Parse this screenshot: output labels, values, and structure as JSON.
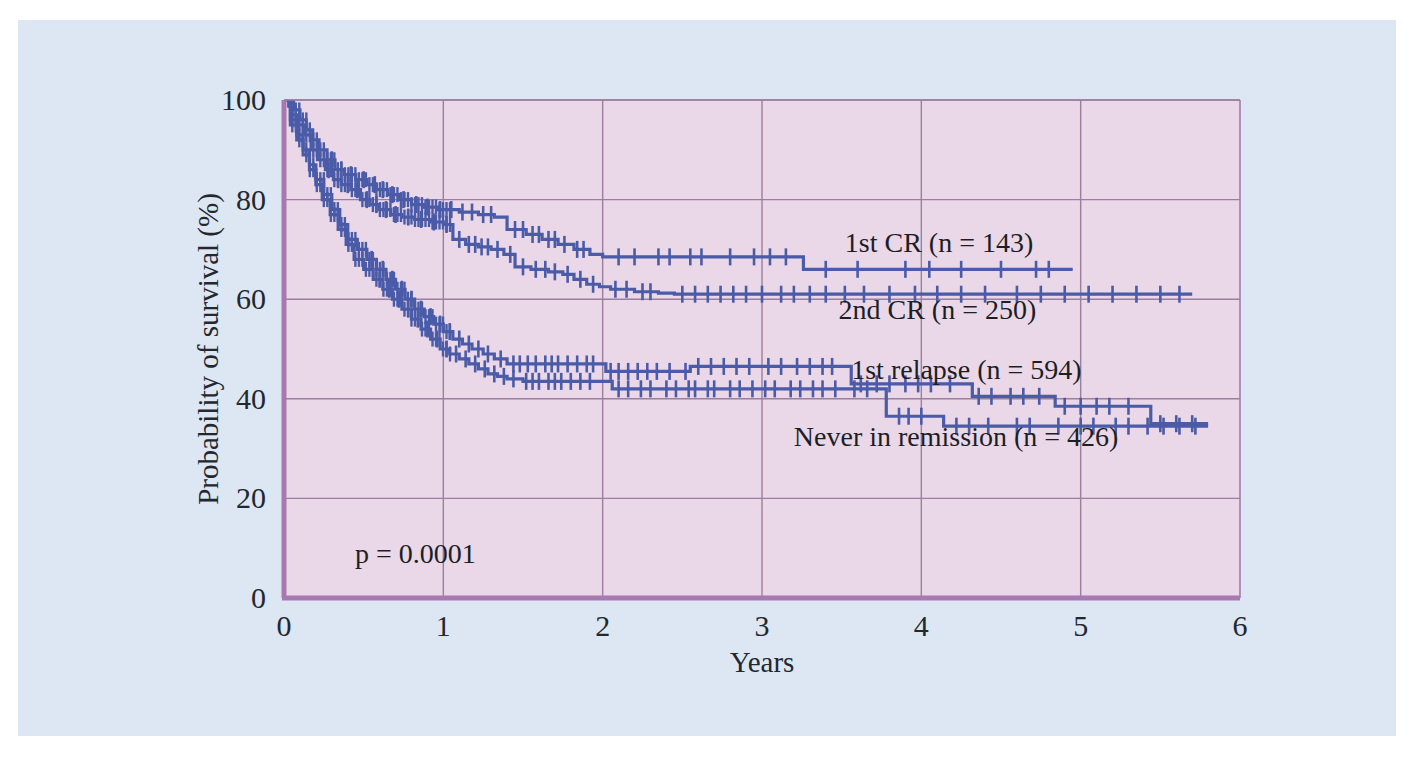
{
  "figure": {
    "background_color": "#dde7f3",
    "plot_background_color": "#ead7e8",
    "plot_border_color": "#a878b0",
    "grid_color": "#9b7fa0",
    "curve_color": "#4a5ba8",
    "page_color": "#ffffff"
  },
  "chart_data": {
    "type": "line",
    "subtype": "kaplan-meier-survival",
    "title": "",
    "xlabel": "Years",
    "ylabel": "Probability of survival (%)",
    "xlim": [
      0,
      6
    ],
    "ylim": [
      0,
      100
    ],
    "xticks": [
      "0",
      "1",
      "2",
      "3",
      "4",
      "5",
      "6"
    ],
    "yticks": [
      "0",
      "20",
      "40",
      "60",
      "80",
      "100"
    ],
    "grid": true,
    "legend_position": "inline-right-of-curves",
    "annotations": [
      {
        "name": "p-value",
        "text": "p = 0.0001",
        "x": 0.38,
        "y": 10
      }
    ],
    "series": [
      {
        "name": "1st CR (n = 143)",
        "label": "1st CR (n = 143)",
        "n": 143,
        "color": "#4a5ba8",
        "label_x": 3.52,
        "label_y": 69.5,
        "plateau_value": 66,
        "points": [
          [
            0.0,
            100
          ],
          [
            0.06,
            98
          ],
          [
            0.1,
            96
          ],
          [
            0.14,
            94
          ],
          [
            0.18,
            92
          ],
          [
            0.22,
            90
          ],
          [
            0.27,
            88
          ],
          [
            0.32,
            86
          ],
          [
            0.38,
            85
          ],
          [
            0.45,
            84
          ],
          [
            0.52,
            83
          ],
          [
            0.58,
            82
          ],
          [
            0.65,
            81
          ],
          [
            0.72,
            80
          ],
          [
            0.8,
            79
          ],
          [
            0.88,
            78.5
          ],
          [
            0.97,
            78
          ],
          [
            1.1,
            77.5
          ],
          [
            1.22,
            77
          ],
          [
            1.32,
            76.5
          ],
          [
            1.4,
            74
          ],
          [
            1.52,
            73
          ],
          [
            1.62,
            72
          ],
          [
            1.72,
            71
          ],
          [
            1.82,
            70
          ],
          [
            1.92,
            69
          ],
          [
            2.0,
            68.5
          ],
          [
            2.3,
            68.5
          ],
          [
            2.7,
            68.5
          ],
          [
            3.1,
            68.5
          ],
          [
            3.24,
            68.5
          ],
          [
            3.26,
            66
          ],
          [
            3.8,
            66
          ],
          [
            4.3,
            66
          ],
          [
            4.7,
            66
          ],
          [
            4.95,
            66
          ]
        ],
        "censor_marks": [
          0.3,
          0.36,
          0.42,
          0.5,
          0.57,
          0.62,
          0.68,
          0.75,
          0.83,
          0.9,
          0.98,
          1.05,
          1.12,
          1.18,
          1.25,
          1.3,
          1.45,
          1.5,
          1.56,
          1.6,
          1.66,
          1.7,
          1.76,
          1.84,
          1.88,
          2.1,
          2.2,
          2.35,
          2.42,
          2.55,
          2.62,
          2.8,
          2.95,
          3.05,
          3.15,
          3.4,
          3.6,
          3.9,
          4.05,
          4.25,
          4.5,
          4.72,
          4.8
        ]
      },
      {
        "name": "2nd CR (n = 250)",
        "label": "2nd CR (n = 250)",
        "n": 250,
        "color": "#4a5ba8",
        "label_x": 3.48,
        "label_y": 56,
        "plateau_value": 61,
        "points": [
          [
            0.0,
            100
          ],
          [
            0.05,
            97
          ],
          [
            0.09,
            95
          ],
          [
            0.13,
            93
          ],
          [
            0.17,
            90
          ],
          [
            0.21,
            88
          ],
          [
            0.26,
            86
          ],
          [
            0.31,
            84
          ],
          [
            0.36,
            83
          ],
          [
            0.42,
            82
          ],
          [
            0.48,
            80
          ],
          [
            0.54,
            79
          ],
          [
            0.6,
            78
          ],
          [
            0.67,
            77
          ],
          [
            0.74,
            76.5
          ],
          [
            0.82,
            76
          ],
          [
            0.92,
            75.5
          ],
          [
            1.0,
            75
          ],
          [
            1.06,
            72
          ],
          [
            1.14,
            71
          ],
          [
            1.22,
            70.5
          ],
          [
            1.3,
            70
          ],
          [
            1.38,
            69
          ],
          [
            1.45,
            66.5
          ],
          [
            1.55,
            66
          ],
          [
            1.66,
            65.5
          ],
          [
            1.75,
            65
          ],
          [
            1.82,
            64
          ],
          [
            1.9,
            63
          ],
          [
            1.98,
            62.5
          ],
          [
            2.05,
            62
          ],
          [
            2.2,
            61.5
          ],
          [
            2.35,
            61.2
          ],
          [
            2.45,
            61
          ],
          [
            3.0,
            61
          ],
          [
            3.6,
            61
          ],
          [
            4.2,
            61
          ],
          [
            4.8,
            61
          ],
          [
            5.4,
            61
          ],
          [
            5.7,
            61
          ]
        ],
        "censor_marks": [
          0.28,
          0.34,
          0.4,
          0.46,
          0.52,
          0.58,
          0.64,
          0.7,
          0.78,
          0.86,
          0.94,
          1.02,
          1.1,
          1.16,
          1.2,
          1.24,
          1.28,
          1.34,
          1.42,
          1.5,
          1.58,
          1.64,
          1.7,
          1.78,
          1.86,
          1.94,
          2.08,
          2.15,
          2.25,
          2.3,
          2.5,
          2.58,
          2.66,
          2.74,
          2.82,
          2.9,
          3.0,
          3.12,
          3.2,
          3.3,
          3.4,
          3.52,
          3.64,
          3.8,
          3.96,
          4.1,
          4.25,
          4.4,
          4.6,
          4.75,
          4.9,
          5.05,
          5.2,
          5.35,
          5.5,
          5.62
        ]
      },
      {
        "name": "1st relapse (n = 594)",
        "label": "1st relapse (n = 594)",
        "n": 594,
        "color": "#4a5ba8",
        "label_x": 3.56,
        "label_y": 44,
        "plateau_value": 35,
        "points": [
          [
            0.0,
            100
          ],
          [
            0.04,
            96
          ],
          [
            0.08,
            93
          ],
          [
            0.12,
            90
          ],
          [
            0.16,
            87
          ],
          [
            0.2,
            84
          ],
          [
            0.25,
            81
          ],
          [
            0.3,
            78
          ],
          [
            0.35,
            75
          ],
          [
            0.4,
            72
          ],
          [
            0.46,
            70
          ],
          [
            0.52,
            68
          ],
          [
            0.58,
            66
          ],
          [
            0.64,
            64
          ],
          [
            0.7,
            62
          ],
          [
            0.76,
            60
          ],
          [
            0.82,
            58
          ],
          [
            0.88,
            56.5
          ],
          [
            0.94,
            55
          ],
          [
            1.0,
            53.5
          ],
          [
            1.06,
            52
          ],
          [
            1.12,
            51
          ],
          [
            1.18,
            50
          ],
          [
            1.25,
            49
          ],
          [
            1.32,
            48
          ],
          [
            1.4,
            47
          ],
          [
            1.5,
            47
          ],
          [
            1.62,
            47
          ],
          [
            1.75,
            47
          ],
          [
            1.88,
            47
          ],
          [
            1.98,
            47
          ],
          [
            2.02,
            45.5
          ],
          [
            2.12,
            45.5
          ],
          [
            2.25,
            45.5
          ],
          [
            2.38,
            45.5
          ],
          [
            2.48,
            45.5
          ],
          [
            2.55,
            46.5
          ],
          [
            2.7,
            46.5
          ],
          [
            2.85,
            46.5
          ],
          [
            3.0,
            46.5
          ],
          [
            3.18,
            46.5
          ],
          [
            3.34,
            46.5
          ],
          [
            3.48,
            46.5
          ],
          [
            3.56,
            43
          ],
          [
            3.7,
            43
          ],
          [
            3.85,
            43
          ],
          [
            4.0,
            43
          ],
          [
            4.12,
            43
          ],
          [
            4.28,
            43
          ],
          [
            4.32,
            40.5
          ],
          [
            4.5,
            40.5
          ],
          [
            4.7,
            40.5
          ],
          [
            4.84,
            38.5
          ],
          [
            5.05,
            38.5
          ],
          [
            5.25,
            38.5
          ],
          [
            5.4,
            38.5
          ],
          [
            5.44,
            35
          ],
          [
            5.6,
            35
          ],
          [
            5.8,
            35
          ]
        ],
        "censor_marks": [
          0.55,
          0.62,
          0.68,
          0.74,
          0.8,
          0.86,
          0.92,
          0.98,
          1.04,
          1.1,
          1.16,
          1.22,
          1.28,
          1.36,
          1.44,
          1.48,
          1.53,
          1.58,
          1.64,
          1.68,
          1.72,
          1.78,
          1.84,
          1.9,
          1.94,
          2.05,
          2.1,
          2.16,
          2.22,
          2.28,
          2.34,
          2.42,
          2.52,
          2.6,
          2.68,
          2.76,
          2.84,
          2.92,
          3.04,
          3.12,
          3.22,
          3.3,
          3.38,
          3.44,
          3.62,
          3.72,
          3.8,
          3.9,
          3.98,
          4.06,
          4.18,
          4.36,
          4.44,
          4.56,
          4.64,
          4.74,
          4.9,
          5.0,
          5.1,
          5.18,
          5.3,
          5.5,
          5.6,
          5.7
        ]
      },
      {
        "name": "Never in remission (n = 426)",
        "label": "Never in remission (n = 426)",
        "n": 426,
        "color": "#4a5ba8",
        "label_x": 3.2,
        "label_y": 30.5,
        "plateau_value": 35,
        "points": [
          [
            0.0,
            100
          ],
          [
            0.04,
            95
          ],
          [
            0.08,
            92
          ],
          [
            0.12,
            89
          ],
          [
            0.16,
            86
          ],
          [
            0.2,
            83
          ],
          [
            0.24,
            80
          ],
          [
            0.29,
            77
          ],
          [
            0.34,
            74
          ],
          [
            0.39,
            71
          ],
          [
            0.44,
            68
          ],
          [
            0.5,
            66
          ],
          [
            0.56,
            64
          ],
          [
            0.62,
            62
          ],
          [
            0.68,
            60
          ],
          [
            0.74,
            58
          ],
          [
            0.8,
            56
          ],
          [
            0.86,
            54
          ],
          [
            0.92,
            52
          ],
          [
            0.98,
            50
          ],
          [
            1.04,
            49
          ],
          [
            1.1,
            48
          ],
          [
            1.16,
            47
          ],
          [
            1.22,
            46
          ],
          [
            1.28,
            45
          ],
          [
            1.34,
            44.5
          ],
          [
            1.4,
            44
          ],
          [
            1.5,
            43.5
          ],
          [
            1.62,
            43.5
          ],
          [
            1.76,
            43.5
          ],
          [
            1.88,
            43.5
          ],
          [
            1.98,
            43.5
          ],
          [
            2.06,
            42
          ],
          [
            2.2,
            42
          ],
          [
            2.35,
            42
          ],
          [
            2.5,
            42
          ],
          [
            2.62,
            42
          ],
          [
            2.74,
            42
          ],
          [
            2.88,
            42
          ],
          [
            3.0,
            42
          ],
          [
            3.14,
            42
          ],
          [
            3.28,
            42
          ],
          [
            3.42,
            42
          ],
          [
            3.54,
            42
          ],
          [
            3.62,
            42
          ],
          [
            3.72,
            42
          ],
          [
            3.78,
            36.5
          ],
          [
            3.95,
            36.5
          ],
          [
            4.1,
            36.5
          ],
          [
            4.14,
            34.5
          ],
          [
            4.35,
            34.5
          ],
          [
            4.55,
            34.5
          ],
          [
            4.75,
            34.5
          ],
          [
            4.95,
            34.5
          ],
          [
            5.15,
            34.5
          ],
          [
            5.35,
            34.5
          ],
          [
            5.55,
            34.5
          ],
          [
            5.8,
            34.5
          ]
        ],
        "censor_marks": [
          0.6,
          0.66,
          0.72,
          0.78,
          0.84,
          0.9,
          0.96,
          1.02,
          1.08,
          1.14,
          1.2,
          1.26,
          1.32,
          1.38,
          1.44,
          1.52,
          1.56,
          1.6,
          1.66,
          1.7,
          1.74,
          1.8,
          1.86,
          1.92,
          2.1,
          2.16,
          2.24,
          2.3,
          2.4,
          2.46,
          2.54,
          2.58,
          2.66,
          2.7,
          2.8,
          2.86,
          2.94,
          3.02,
          3.08,
          3.18,
          3.24,
          3.32,
          3.38,
          3.46,
          3.58,
          3.66,
          3.86,
          3.92,
          4.0,
          4.22,
          4.3,
          4.42,
          4.6,
          4.68,
          4.86,
          5.0,
          5.08,
          5.22,
          5.3,
          5.42,
          5.52,
          5.62,
          5.72
        ]
      }
    ],
    "early_dense_ticks_note": "Dense censoring marks overlay all curves between 0 and 1 year"
  }
}
